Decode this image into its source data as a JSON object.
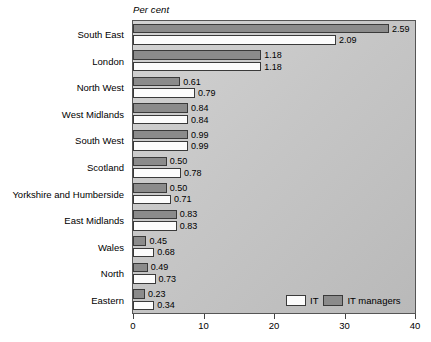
{
  "chart_data": {
    "type": "bar",
    "orientation": "horizontal",
    "title": "",
    "unit_caption": "Per cent",
    "xlabel": "",
    "ylabel": "",
    "xlim": [
      0,
      40
    ],
    "xticks": [
      0,
      10,
      20,
      30,
      40
    ],
    "xtick_labels": [
      "0",
      "10",
      "20",
      "30",
      "40"
    ],
    "grid": false,
    "legend_position": "bottom-right",
    "categories": [
      "South East",
      "London",
      "North West",
      "West Midlands",
      "South West",
      "Scotland",
      "Yorkshire and Humberside",
      "East Midlands",
      "Wales",
      "North",
      "Eastern"
    ],
    "series": [
      {
        "name": "IT managers",
        "color": "#8b8b8b",
        "labels": [
          "2.59",
          "1.18",
          "0.61",
          "0.84",
          "0.99",
          "0.50",
          "0.50",
          "0.83",
          "0.45",
          "0.49",
          "0.23"
        ],
        "values": [
          2.59,
          1.18,
          0.61,
          0.84,
          0.99,
          0.5,
          0.5,
          0.83,
          0.45,
          0.49,
          0.23
        ],
        "bar_extent_axis_units": [
          36.3,
          18.2,
          6.7,
          7.8,
          7.8,
          4.8,
          4.8,
          6.2,
          1.9,
          2.1,
          1.7
        ]
      },
      {
        "name": "IT",
        "color": "#fcfcfc",
        "labels": [
          "2.09",
          "1.18",
          "0.79",
          "0.84",
          "0.99",
          "0.78",
          "0.71",
          "0.83",
          "0.68",
          "0.73",
          "0.34"
        ],
        "values": [
          2.09,
          1.18,
          0.79,
          0.84,
          0.99,
          0.78,
          0.71,
          0.83,
          0.68,
          0.73,
          0.34
        ],
        "bar_extent_axis_units": [
          28.8,
          18.2,
          8.8,
          7.8,
          7.8,
          6.8,
          5.4,
          6.2,
          3.0,
          3.2,
          3.0
        ]
      }
    ],
    "legend": [
      {
        "label": "IT",
        "color": "#fcfcfc"
      },
      {
        "label": "IT managers",
        "color": "#8b8b8b"
      }
    ]
  }
}
